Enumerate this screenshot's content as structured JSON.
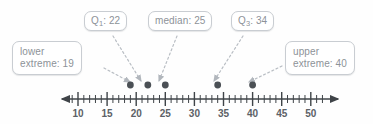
{
  "figure": {
    "background_color": "#fefefe"
  },
  "chart_data": {
    "type": "scatter",
    "title": "",
    "xlabel": "",
    "ylabel": "",
    "xlim": [
      8,
      53
    ],
    "grid": false,
    "legend_position": "none",
    "axis": {
      "line_color": "#3f4448",
      "arrow_left": true,
      "arrow_right": true,
      "tick_start": 9,
      "tick_end": 52,
      "tick_step": 1,
      "major_tick_step": 5,
      "tick_labels": [
        "10",
        "15",
        "20",
        "25",
        "30",
        "35",
        "40",
        "45",
        "50"
      ],
      "tick_label_values": [
        10,
        15,
        20,
        25,
        30,
        35,
        40,
        45,
        50
      ]
    },
    "points": [
      {
        "label": "lower extreme",
        "value": 19
      },
      {
        "label": "Q1",
        "value": 22
      },
      {
        "label": "median",
        "value": 25
      },
      {
        "label": "Q3",
        "value": 34
      },
      {
        "label": "upper extreme",
        "value": 40
      }
    ],
    "point_color": "#4b5055",
    "values": [
      19,
      22,
      25,
      34,
      40
    ],
    "categories": [
      "lower extreme",
      "Q1",
      "median",
      "Q3",
      "upper extreme"
    ]
  },
  "callouts": {
    "q1": {
      "name": "Q1",
      "text_prefix": "Q",
      "subscript": "1",
      "text_suffix": ": 22",
      "value": 22
    },
    "median": {
      "name": "median",
      "text": "median: 25",
      "value": 25
    },
    "q3": {
      "name": "Q3",
      "text_prefix": "Q",
      "subscript": "3",
      "text_suffix": ": 34",
      "value": 34
    },
    "lower_extreme": {
      "name": "lower extreme",
      "line1": "lower",
      "line2": "extreme: 19",
      "value": 19
    },
    "upper_extreme": {
      "name": "upper extreme",
      "line1": "upper",
      "line2": "extreme: 40",
      "value": 40
    }
  },
  "colors": {
    "callout_border": "#c9cdd2",
    "callout_text": "#8d9298",
    "tick_label_text": "#5c6166",
    "axis": "#3f4448",
    "point": "#4b5055",
    "connector": "#b9bec4"
  }
}
